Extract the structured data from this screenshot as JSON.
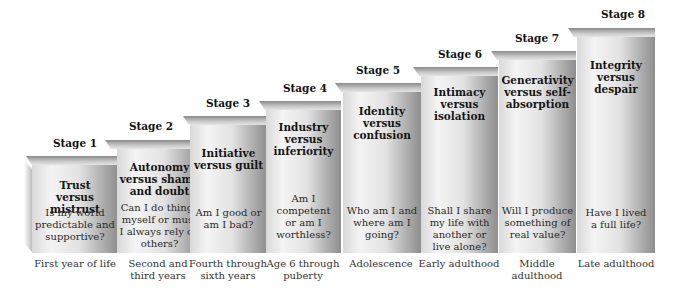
{
  "diagram": {
    "stages": [
      {
        "label": "Stage 1",
        "crisis": "Trust versus mistrust",
        "question": "Is my world predictable and supportive?",
        "age": "First year of life"
      },
      {
        "label": "Stage 2",
        "crisis": "Autonomy versus shame and doubt",
        "question": "Can I do things myself or must I always rely on others?",
        "age": "Second and third years"
      },
      {
        "label": "Stage 3",
        "crisis": "Initiative versus guilt",
        "question": "Am I good or am I bad?",
        "age": "Fourth through sixth years"
      },
      {
        "label": "Stage 4",
        "crisis": "Industry versus inferiority",
        "question": "Am I competent or am I worthless?",
        "age": "Age 6 through puberty"
      },
      {
        "label": "Stage 5",
        "crisis": "Identity versus confusion",
        "question": "Who am I and where am I going?",
        "age": "Adolescence"
      },
      {
        "label": "Stage 6",
        "crisis": "Intimacy versus isolation",
        "question": "Shall I share my life with another or live alone?",
        "age": "Early adulthood"
      },
      {
        "label": "Stage 7",
        "crisis": "Generativity versus self-absorption",
        "question": "Will I produce something of real value?",
        "age": "Middle adulthood"
      },
      {
        "label": "Stage 8",
        "crisis": "Integrity versus despair",
        "question": "Have I lived a full life?",
        "age": "Late adulthood"
      }
    ]
  }
}
